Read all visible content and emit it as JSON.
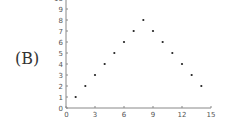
{
  "panel_label": "(B)",
  "chart_data": {
    "type": "scatter",
    "title": "",
    "xlabel": "",
    "ylabel": "",
    "xlim": [
      0,
      15
    ],
    "ylim": [
      0,
      10
    ],
    "grid": false,
    "legend": null,
    "x_ticks": [
      0,
      3,
      6,
      9,
      12,
      15
    ],
    "y_ticks": [
      0,
      1,
      2,
      3,
      4,
      5,
      6,
      7,
      8,
      9
    ],
    "series": [
      {
        "name": "points",
        "x": [
          1,
          2,
          3,
          4,
          5,
          6,
          7,
          8,
          9,
          10,
          11,
          12,
          13,
          14
        ],
        "y": [
          1,
          2,
          3,
          4,
          5,
          6,
          7,
          8,
          7,
          6,
          5,
          4,
          3,
          2
        ]
      }
    ]
  },
  "colors": {
    "axis": "#888888",
    "point": "#222222",
    "text": "#555555"
  }
}
